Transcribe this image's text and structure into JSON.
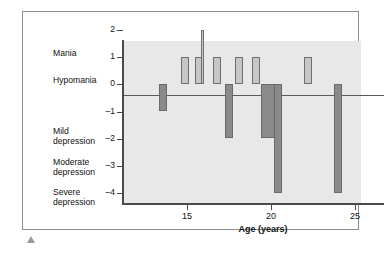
{
  "chart_data": {
    "type": "bar",
    "title": "",
    "subtitle": "",
    "xlabel": "Age (years)",
    "ylabel": "",
    "xlim": [
      13,
      27
    ],
    "ylim": [
      -4,
      2
    ],
    "grid": false,
    "legend_position": "none",
    "x_ticks": [
      {
        "value": 15,
        "label": "15"
      },
      {
        "value": 20,
        "label": "20"
      },
      {
        "value": 25,
        "label": "25"
      }
    ],
    "y_ticks": [
      {
        "value": 2,
        "label": "2"
      },
      {
        "value": 1,
        "label": "1"
      },
      {
        "value": 0,
        "label": "0"
      },
      {
        "value": -1,
        "label": "–1"
      },
      {
        "value": -2,
        "label": "–2"
      },
      {
        "value": -3,
        "label": "–3"
      },
      {
        "value": -4,
        "label": "–4"
      }
    ],
    "severity_annotations": [
      {
        "label": "Mania",
        "value": 1.55
      },
      {
        "label": "Hypomania",
        "value": 0.55
      },
      {
        "label": "Mild\ndepression",
        "value": -1.1
      },
      {
        "label": "Moderate\ndepression",
        "value": -2.25
      },
      {
        "label": "Severe\ndepression",
        "value": -3.35
      }
    ],
    "categories": [
      "13.6",
      "14.9",
      "15.7",
      "15.9",
      "16.8",
      "17.5",
      "18.1",
      "19.1",
      "19.9",
      "20.4",
      "22.2",
      "24.0"
    ],
    "values": [
      -1,
      1,
      1,
      2,
      1,
      -2,
      1,
      1,
      -2,
      -4,
      1,
      -4
    ],
    "series": [
      {
        "name": "Mood episode severity",
        "color_positive": "#c6c6c6",
        "color_negative": "#8a8a8a",
        "points": [
          {
            "age": 13.6,
            "value": -1,
            "width": 0.45
          },
          {
            "age": 14.9,
            "value": 1,
            "width": 0.45
          },
          {
            "age": 15.7,
            "value": 1,
            "width": 0.45
          },
          {
            "age": 15.9,
            "value": 2,
            "width": 0.2
          },
          {
            "age": 16.8,
            "value": 1,
            "width": 0.45
          },
          {
            "age": 17.5,
            "value": -2,
            "width": 0.45
          },
          {
            "age": 18.1,
            "value": 1,
            "width": 0.5
          },
          {
            "age": 19.1,
            "value": 1,
            "width": 0.5
          },
          {
            "age": 19.9,
            "value": -2,
            "width": 0.95
          },
          {
            "age": 20.4,
            "value": -4,
            "width": 0.5
          },
          {
            "age": 22.2,
            "value": 1,
            "width": 0.5
          },
          {
            "age": 24.0,
            "value": -4,
            "width": 0.5
          }
        ]
      }
    ],
    "colors": {
      "plot_background": "#e8e8e8",
      "axis": "#4a4a4a",
      "positive_bar_fill": "#c6c6c6",
      "positive_bar_stroke": "#6f6f6f",
      "negative_bar_fill": "#8a8a8a",
      "negative_bar_stroke": "#6a6a6a",
      "frame": "#8d8d8d",
      "text": "#111111"
    }
  }
}
